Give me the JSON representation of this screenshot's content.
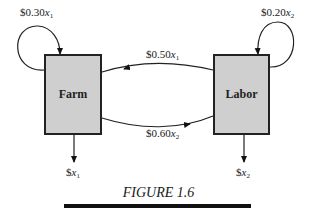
{
  "figure": {
    "caption": "FIGURE 1.6",
    "nodes": [
      {
        "id": "farm",
        "label": "Farm"
      },
      {
        "id": "labor",
        "label": "Labor"
      }
    ],
    "edges": [
      {
        "from": "farm",
        "to": "farm",
        "label_prefix": "$0.30",
        "var": "x",
        "sub": "1"
      },
      {
        "from": "labor",
        "to": "labor",
        "label_prefix": "$0.20",
        "var": "x",
        "sub": "2"
      },
      {
        "from": "labor",
        "to": "farm",
        "label_prefix": "$0.50",
        "var": "x",
        "sub": "1"
      },
      {
        "from": "farm",
        "to": "labor",
        "label_prefix": "$0.60",
        "var": "x",
        "sub": "2"
      },
      {
        "from": "farm",
        "to": "out",
        "label_prefix": "$",
        "var": "x",
        "sub": "1"
      },
      {
        "from": "labor",
        "to": "out",
        "label_prefix": "$",
        "var": "x",
        "sub": "2"
      }
    ]
  }
}
